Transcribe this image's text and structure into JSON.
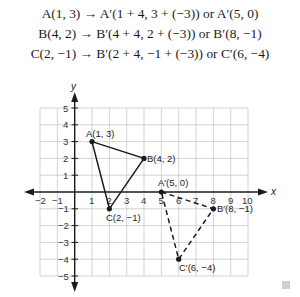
{
  "equations": [
    "A(1, 3) → A′(1 + 4, 3 + (−3)) or A′(5, 0)",
    "B(4, 2) → B′(4 + 4, 2 + (−3)) or B′(8, −1)",
    "C(2, −1) → B′(2 + 4, −1 + (−3)) or C′(6, −4)"
  ],
  "graph": {
    "x_axis_label": "x",
    "y_axis_label": "y",
    "x_ticks": [
      "−2",
      "−1",
      "1",
      "2",
      "3",
      "4",
      "5",
      "6",
      "7",
      "8",
      "9",
      "10"
    ],
    "y_ticks": [
      "5",
      "4",
      "3",
      "2",
      "1",
      "−1",
      "−2",
      "−3",
      "−4",
      "−5"
    ],
    "xlim": [
      -2,
      10
    ],
    "ylim": [
      -5,
      5
    ],
    "original_triangle": {
      "points": [
        {
          "label": "A(1, 3)",
          "x": 1,
          "y": 3
        },
        {
          "label": "B(4, 2)",
          "x": 4,
          "y": 2
        },
        {
          "label": "C(2, −1)",
          "x": 2,
          "y": -1
        }
      ],
      "style": "solid"
    },
    "image_triangle": {
      "points": [
        {
          "label": "A′(5, 0)",
          "x": 5,
          "y": 0
        },
        {
          "label": "B′(8, −1)",
          "x": 8,
          "y": -1
        },
        {
          "label": "C′(6, −4)",
          "x": 6,
          "y": -4
        }
      ],
      "style": "dashed"
    },
    "colors": {
      "grid": "#c8c8c8",
      "axis": "#1a1a1a",
      "line": "#1a1a1a"
    }
  }
}
